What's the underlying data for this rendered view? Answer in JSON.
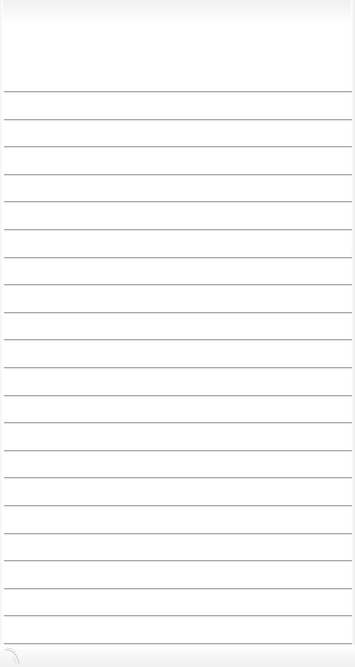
{
  "app": {
    "type": "notepad",
    "page": "blank lined page"
  },
  "paper": {
    "background_color": "#ffffff",
    "line_color": "#a9a9a9",
    "line_count": 21,
    "first_line_y": 91,
    "line_spacing": 27.6,
    "lines": [
      {
        "index": 1,
        "text": ""
      },
      {
        "index": 2,
        "text": ""
      },
      {
        "index": 3,
        "text": ""
      },
      {
        "index": 4,
        "text": ""
      },
      {
        "index": 5,
        "text": ""
      },
      {
        "index": 6,
        "text": ""
      },
      {
        "index": 7,
        "text": ""
      },
      {
        "index": 8,
        "text": ""
      },
      {
        "index": 9,
        "text": ""
      },
      {
        "index": 10,
        "text": ""
      },
      {
        "index": 11,
        "text": ""
      },
      {
        "index": 12,
        "text": ""
      },
      {
        "index": 13,
        "text": ""
      },
      {
        "index": 14,
        "text": ""
      },
      {
        "index": 15,
        "text": ""
      },
      {
        "index": 16,
        "text": ""
      },
      {
        "index": 17,
        "text": ""
      },
      {
        "index": 18,
        "text": ""
      },
      {
        "index": 19,
        "text": ""
      },
      {
        "index": 20,
        "text": ""
      },
      {
        "index": 21,
        "text": ""
      }
    ]
  },
  "icons": {
    "page_curl": "page-curl-icon"
  }
}
